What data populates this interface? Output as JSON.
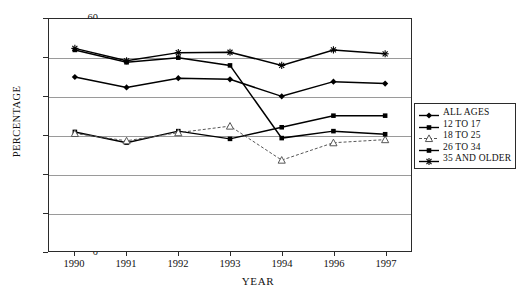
{
  "chart_data": {
    "type": "line",
    "title": "",
    "xlabel": "YEAR",
    "ylabel": "PERCENTAGE",
    "ylim": [
      0,
      60
    ],
    "ytick_values": [
      0,
      10,
      20,
      30,
      40,
      50,
      60
    ],
    "ytick_labels": [
      "0",
      "10",
      "20",
      "30",
      "40",
      "50",
      "60"
    ],
    "grid": true,
    "grid_axis": "y",
    "legend_position": "right",
    "categories": [
      "1990",
      "1991",
      "1992",
      "1993",
      "1994",
      "1996",
      "1997"
    ],
    "series": [
      {
        "name": "ALL AGES",
        "marker": "diamond",
        "line_style": "solid",
        "color": "#000000",
        "values": [
          45.0,
          42.3,
          44.7,
          44.4,
          40.0,
          43.8,
          43.3
        ]
      },
      {
        "name": "12 TO 17",
        "marker": "square",
        "line_style": "solid",
        "color": "#000000",
        "values": [
          30.8,
          28.0,
          31.0,
          29.0,
          32.0,
          35.0,
          35.0
        ]
      },
      {
        "name": "18 TO 25",
        "marker": "triangle",
        "line_style": "dashed",
        "color": "#555555",
        "values": [
          30.4,
          28.5,
          30.6,
          32.3,
          23.5,
          28.0,
          28.8
        ]
      },
      {
        "name": "26 TO 34",
        "marker": "square",
        "line_style": "solid",
        "color": "#000000",
        "values": [
          52.0,
          48.8,
          50.0,
          48.0,
          29.2,
          31.0,
          30.2
        ]
      },
      {
        "name": "35 AND OLDER",
        "marker": "star",
        "line_style": "solid",
        "color": "#000000",
        "values": [
          52.4,
          49.2,
          51.3,
          51.4,
          48.0,
          52.0,
          51.0
        ]
      }
    ]
  },
  "legend": {
    "items": [
      {
        "label": "ALL AGES"
      },
      {
        "label": "12 TO 17"
      },
      {
        "label": "18 TO 25"
      },
      {
        "label": "26 TO 34"
      },
      {
        "label": "35 AND OLDER"
      }
    ]
  },
  "axes": {
    "x_title": "YEAR",
    "y_title": "PERCENTAGE"
  }
}
